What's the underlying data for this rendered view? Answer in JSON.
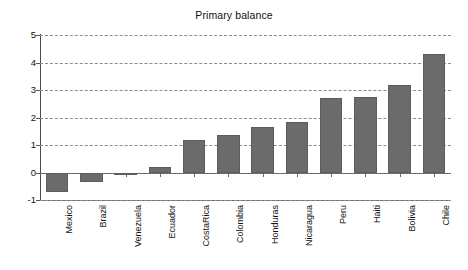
{
  "chart_data": {
    "type": "bar",
    "title": "Primary balance",
    "xlabel": "",
    "ylabel": "",
    "categories": [
      "Mexico",
      "Brazil",
      "Venezuela",
      "Ecuador",
      "CostaRica",
      "Colombia",
      "Honduras",
      "Nicaragua",
      "Peru",
      "Haiti",
      "Bolivia",
      "Chile"
    ],
    "values": [
      -0.7,
      -0.35,
      -0.1,
      0.2,
      1.2,
      1.35,
      1.65,
      1.85,
      2.7,
      2.75,
      3.2,
      4.3
    ],
    "ylim": [
      -1,
      5
    ],
    "yticks": [
      -1,
      0,
      1,
      2,
      3,
      4,
      5
    ],
    "ytick_labels": [
      "-1",
      "0",
      "1",
      "2",
      "3",
      "4",
      "5"
    ],
    "grid": true,
    "grid_style": "dashed-horizontal",
    "legend": null,
    "legend_position": "none",
    "bar_color": "#6b6b6b",
    "bar_edge_color": "#5d5d5d",
    "background_color": "#ffffff",
    "axis_color": "#4a4a4a",
    "gridline_color": "#8c8c8c",
    "text_color": "#111111",
    "xtick_label_rotation": 90
  }
}
